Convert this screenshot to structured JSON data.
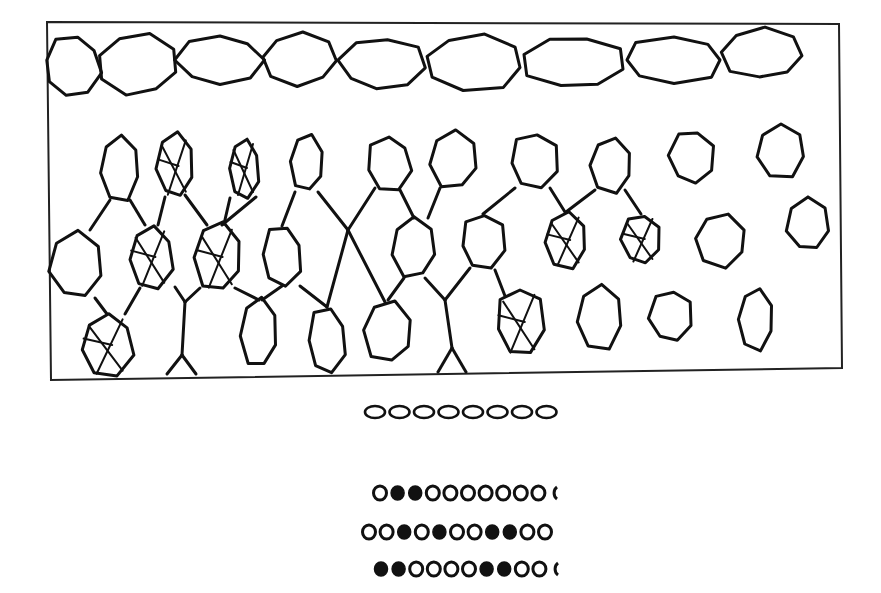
{
  "figure": {
    "background": "#ffffff",
    "ink": "#111111",
    "frame": {
      "x1": 47,
      "y1": 22,
      "x2": 842,
      "y2": 380
    },
    "top_row_cells": [
      {
        "cx": 72,
        "cy": 66,
        "rx": 28,
        "ry": 30
      },
      {
        "cx": 138,
        "cy": 64,
        "rx": 40,
        "ry": 30
      },
      {
        "cx": 220,
        "cy": 60,
        "rx": 42,
        "ry": 25
      },
      {
        "cx": 300,
        "cy": 59,
        "rx": 38,
        "ry": 26
      },
      {
        "cx": 382,
        "cy": 64,
        "rx": 42,
        "ry": 26
      },
      {
        "cx": 474,
        "cy": 62,
        "rx": 50,
        "ry": 28
      },
      {
        "cx": 574,
        "cy": 62,
        "rx": 50,
        "ry": 26
      },
      {
        "cx": 674,
        "cy": 60,
        "rx": 50,
        "ry": 23
      },
      {
        "cx": 762,
        "cy": 54,
        "rx": 40,
        "ry": 25
      }
    ],
    "lower_cells": [
      {
        "cx": 120,
        "cy": 168,
        "rx": 20,
        "ry": 33,
        "marked": false
      },
      {
        "cx": 175,
        "cy": 166,
        "rx": 18,
        "ry": 32,
        "marked": true
      },
      {
        "cx": 244,
        "cy": 168,
        "rx": 15,
        "ry": 30,
        "marked": true
      },
      {
        "cx": 307,
        "cy": 163,
        "rx": 16,
        "ry": 28,
        "marked": false
      },
      {
        "cx": 389,
        "cy": 164,
        "rx": 22,
        "ry": 28,
        "marked": false
      },
      {
        "cx": 454,
        "cy": 160,
        "rx": 24,
        "ry": 29,
        "marked": false
      },
      {
        "cx": 534,
        "cy": 161,
        "rx": 24,
        "ry": 28,
        "marked": false
      },
      {
        "cx": 611,
        "cy": 165,
        "rx": 21,
        "ry": 27,
        "marked": false
      },
      {
        "cx": 692,
        "cy": 157,
        "rx": 22,
        "ry": 27,
        "marked": false
      },
      {
        "cx": 781,
        "cy": 151,
        "rx": 25,
        "ry": 27,
        "marked": false
      },
      {
        "cx": 76,
        "cy": 266,
        "rx": 26,
        "ry": 33,
        "marked": false
      },
      {
        "cx": 151,
        "cy": 257,
        "rx": 22,
        "ry": 32,
        "marked": true
      },
      {
        "cx": 218,
        "cy": 257,
        "rx": 23,
        "ry": 34,
        "marked": true
      },
      {
        "cx": 282,
        "cy": 256,
        "rx": 20,
        "ry": 30,
        "marked": false
      },
      {
        "cx": 414,
        "cy": 248,
        "rx": 22,
        "ry": 30,
        "marked": false
      },
      {
        "cx": 483,
        "cy": 242,
        "rx": 22,
        "ry": 28,
        "marked": false
      },
      {
        "cx": 566,
        "cy": 240,
        "rx": 21,
        "ry": 28,
        "marked": true
      },
      {
        "cx": 641,
        "cy": 239,
        "rx": 19,
        "ry": 25,
        "marked": true
      },
      {
        "cx": 721,
        "cy": 240,
        "rx": 26,
        "ry": 27,
        "marked": false
      },
      {
        "cx": 808,
        "cy": 225,
        "rx": 21,
        "ry": 26,
        "marked": false
      },
      {
        "cx": 107,
        "cy": 345,
        "rx": 26,
        "ry": 32,
        "marked": true
      },
      {
        "cx": 259,
        "cy": 333,
        "rx": 18,
        "ry": 34,
        "marked": false
      },
      {
        "cx": 327,
        "cy": 340,
        "rx": 19,
        "ry": 33,
        "marked": false
      },
      {
        "cx": 388,
        "cy": 332,
        "rx": 24,
        "ry": 31,
        "marked": false
      },
      {
        "cx": 520,
        "cy": 322,
        "rx": 24,
        "ry": 34,
        "marked": true
      },
      {
        "cx": 600,
        "cy": 317,
        "rx": 23,
        "ry": 32,
        "marked": false
      },
      {
        "cx": 671,
        "cy": 316,
        "rx": 21,
        "ry": 26,
        "marked": false
      },
      {
        "cx": 756,
        "cy": 319,
        "rx": 18,
        "ry": 31,
        "marked": false
      }
    ],
    "connectors": [
      [
        110,
        200,
        90,
        230
      ],
      [
        130,
        200,
        145,
        225
      ],
      [
        165,
        197,
        158,
        225
      ],
      [
        185,
        195,
        207,
        225
      ],
      [
        230,
        198,
        224,
        224
      ],
      [
        256,
        197,
        222,
        225
      ],
      [
        295,
        192,
        282,
        226
      ],
      [
        318,
        192,
        348,
        230
      ],
      [
        375,
        188,
        348,
        230
      ],
      [
        400,
        190,
        414,
        218
      ],
      [
        440,
        188,
        428,
        218
      ],
      [
        515,
        188,
        483,
        214
      ],
      [
        550,
        188,
        565,
        212
      ],
      [
        595,
        190,
        566,
        212
      ],
      [
        625,
        190,
        641,
        214
      ],
      [
        95,
        298,
        107,
        314
      ],
      [
        140,
        288,
        125,
        314
      ],
      [
        175,
        287,
        185,
        302
      ],
      [
        200,
        288,
        185,
        302
      ],
      [
        185,
        302,
        182,
        355
      ],
      [
        182,
        355,
        167,
        374
      ],
      [
        182,
        355,
        196,
        374
      ],
      [
        235,
        288,
        259,
        300
      ],
      [
        282,
        286,
        262,
        300
      ],
      [
        300,
        286,
        327,
        307
      ],
      [
        348,
        230,
        327,
        307
      ],
      [
        348,
        230,
        385,
        302
      ],
      [
        404,
        278,
        388,
        300
      ],
      [
        425,
        278,
        445,
        300
      ],
      [
        445,
        300,
        452,
        348
      ],
      [
        452,
        348,
        438,
        372
      ],
      [
        452,
        348,
        466,
        372
      ],
      [
        495,
        270,
        505,
        296
      ],
      [
        470,
        268,
        445,
        300
      ]
    ],
    "separator_row": {
      "y": 412,
      "x_start": 375,
      "spacing": 24.5,
      "count": 8,
      "ellipse_rx": 10,
      "ellipse_ry": 6
    },
    "dot_rows": [
      {
        "y": 493,
        "x_start": 380,
        "spacing": 17.6,
        "pattern": "o●●oooooooo",
        "last_partial": true
      },
      {
        "y": 532,
        "x_start": 369,
        "spacing": 17.6,
        "pattern": "oo●o●oo●●oo",
        "last_partial": false
      },
      {
        "y": 569,
        "x_start": 381,
        "spacing": 17.6,
        "pattern": "●●oooo●●ooo",
        "last_partial": true
      }
    ]
  }
}
